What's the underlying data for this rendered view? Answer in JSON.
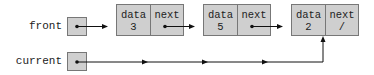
{
  "variables": [
    {
      "name": "front"
    },
    {
      "name": "current"
    }
  ],
  "nodes": [
    {
      "data_label": "data",
      "next_label": "next",
      "data": "3",
      "next": ""
    },
    {
      "data_label": "data",
      "next_label": "next",
      "data": "5",
      "next": ""
    },
    {
      "data_label": "data",
      "next_label": "next",
      "data": "2",
      "next": "/"
    }
  ],
  "pointers": [
    {
      "from": "front",
      "to": "node-0"
    },
    {
      "from": "node-0.next",
      "to": "node-1"
    },
    {
      "from": "node-1.next",
      "to": "node-2"
    },
    {
      "from": "node-2.next",
      "to": "null"
    },
    {
      "from": "current",
      "to": "node-2"
    }
  ],
  "colors": {
    "box_fill": "#cfcfcf",
    "box_border": "#777777",
    "line": "#111111"
  }
}
